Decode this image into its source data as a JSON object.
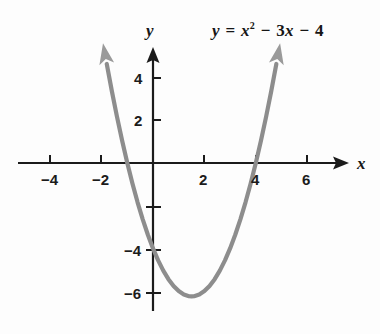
{
  "figure": {
    "background_color": "#fdfdfd",
    "axis_color": "#1b1b1b",
    "curve_color": "#8d8d8d",
    "x_axis_name": "x",
    "y_axis_name": "y"
  },
  "equation": {
    "lhs": "y",
    "equals": "=",
    "term1_var": "x",
    "term1_exp": "2",
    "op1": "−",
    "term2_coef": "3",
    "term2_var": "x",
    "op2": "−",
    "term3": "4",
    "plain": "y = x² − 3x − 4"
  },
  "ticks": {
    "x_labels": [
      "−4",
      "−2",
      "2",
      "4",
      "6"
    ],
    "y_labels": [
      "4",
      "2",
      "−4",
      "−6"
    ]
  },
  "chart_data": {
    "type": "line",
    "title": "",
    "subtitle": "",
    "xlabel": "x",
    "ylabel": "y",
    "equation": "y = x^2 - 3x - 4",
    "function": "quadratic",
    "coefficients": {
      "a": 1,
      "b": -3,
      "c": -4
    },
    "vertex": {
      "x": 1.5,
      "y": -6.25
    },
    "roots": [
      -1,
      4
    ],
    "y_intercept": -4,
    "axis_of_symmetry": 1.5,
    "opens": "upward",
    "xlim": [
      -5.4,
      7.5
    ],
    "ylim": [
      -8,
      5.6
    ],
    "xticks": [
      -4,
      -2,
      2,
      4,
      6
    ],
    "yticks": [
      4,
      2,
      -2,
      -4,
      -6
    ],
    "xtick_labels": [
      "−4",
      "−2",
      "2",
      "4",
      "6"
    ],
    "ytick_labels": [
      "4",
      "2",
      "",
      "−4",
      "−6"
    ],
    "grid": false,
    "legend": null,
    "arrows": {
      "x_axis": "right",
      "y_axis": "up",
      "curve": "both ends"
    },
    "x": [
      -1.8,
      -1.6,
      -1.4,
      -1.2,
      -1.0,
      -0.8,
      -0.6,
      -0.4,
      -0.2,
      0.0,
      0.2,
      0.4,
      0.6,
      0.8,
      1.0,
      1.2,
      1.4,
      1.5,
      1.6,
      1.8,
      2.0,
      2.2,
      2.4,
      2.6,
      2.8,
      3.0,
      3.2,
      3.4,
      3.6,
      3.8,
      4.0,
      4.2,
      4.4,
      4.6,
      4.8
    ],
    "y": [
      4.64,
      3.36,
      2.16,
      1.04,
      0.0,
      -0.96,
      -1.84,
      -2.64,
      -3.36,
      -4.0,
      -4.56,
      -5.04,
      -5.44,
      -5.76,
      -6.0,
      -6.16,
      -6.24,
      -6.25,
      -6.24,
      -6.16,
      -6.0,
      -5.76,
      -5.44,
      -5.04,
      -4.56,
      -4.0,
      -3.36,
      -2.64,
      -1.84,
      -0.96,
      0.0,
      1.04,
      2.16,
      3.36,
      4.64
    ]
  }
}
